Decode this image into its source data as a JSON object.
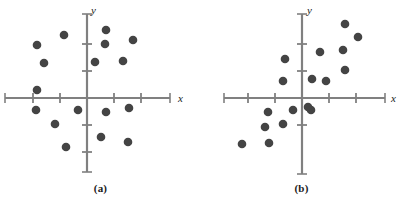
{
  "figure": {
    "width": 402,
    "height": 206,
    "background": "#ffffff",
    "dot_color": "#444444",
    "axis_color": "#808080",
    "label_color": "#1a1a1a"
  },
  "chart_data": [
    {
      "type": "scatter",
      "title": "(a)",
      "caption": "(a)",
      "xlabel": "x",
      "ylabel": "y",
      "grid": false,
      "legend": "none",
      "description": "No correlation — points scattered in all four quadrants",
      "origin_px": [
        87,
        98
      ],
      "unit_px": 27,
      "xlim": [
        -3.1,
        3.1
      ],
      "ylim": [
        -2.9,
        3.0
      ],
      "x_axis_px": [
        5,
        170
      ],
      "y_axis_px": [
        14,
        172
      ],
      "x_ticks": [
        -2,
        -1,
        1,
        2
      ],
      "y_ticks": [
        -2,
        -1,
        1,
        2
      ],
      "points_px": [
        [
          106,
          30
        ],
        [
          64,
          35
        ],
        [
          105,
          44
        ],
        [
          133,
          40
        ],
        [
          37,
          45
        ],
        [
          95,
          62
        ],
        [
          44,
          63
        ],
        [
          123,
          61
        ],
        [
          37,
          90
        ],
        [
          36,
          110
        ],
        [
          78,
          110
        ],
        [
          106,
          112
        ],
        [
          129,
          108
        ],
        [
          55,
          124
        ],
        [
          101,
          137
        ],
        [
          66,
          147
        ],
        [
          128,
          142
        ]
      ],
      "points": [
        [
          0.7,
          2.52
        ],
        [
          -0.85,
          2.33
        ],
        [
          0.67,
          2.0
        ],
        [
          1.7,
          2.15
        ],
        [
          -1.85,
          1.96
        ],
        [
          0.3,
          1.33
        ],
        [
          -1.59,
          1.3
        ],
        [
          1.33,
          1.37
        ],
        [
          -1.85,
          0.3
        ],
        [
          -1.89,
          -0.44
        ],
        [
          -0.33,
          -0.44
        ],
        [
          0.7,
          -0.52
        ],
        [
          1.56,
          -0.37
        ],
        [
          -1.19,
          -0.96
        ],
        [
          0.52,
          -1.44
        ],
        [
          -0.78,
          -1.81
        ],
        [
          1.52,
          -1.63
        ]
      ]
    },
    {
      "type": "scatter",
      "title": "(b)",
      "caption": "(b)",
      "xlabel": "x",
      "ylabel": "y",
      "grid": false,
      "legend": "none",
      "description": "Positive linear correlation — points trend upward left to right",
      "origin_px": [
        302,
        98
      ],
      "unit_px": 27,
      "xlim": [
        -3.0,
        3.1
      ],
      "ylim": [
        -2.9,
        3.0
      ],
      "x_axis_px": [
        224,
        385
      ],
      "y_axis_px": [
        14,
        174
      ],
      "x_ticks": [
        -2,
        -1,
        1,
        2
      ],
      "y_ticks": [
        -1,
        1,
        2
      ],
      "points_px": [
        [
          345,
          24
        ],
        [
          358,
          37
        ],
        [
          320,
          52
        ],
        [
          343,
          50
        ],
        [
          285,
          59
        ],
        [
          345,
          70
        ],
        [
          283,
          81
        ],
        [
          312,
          79
        ],
        [
          326,
          81
        ],
        [
          311,
          110
        ],
        [
          293,
          110
        ],
        [
          268,
          112
        ],
        [
          265,
          127
        ],
        [
          283,
          124
        ],
        [
          242,
          144
        ],
        [
          269,
          143
        ],
        [
          308,
          107
        ]
      ],
      "points": [
        [
          1.59,
          2.74
        ],
        [
          2.07,
          2.26
        ],
        [
          0.67,
          1.7
        ],
        [
          1.52,
          1.78
        ],
        [
          -0.63,
          1.44
        ],
        [
          1.59,
          1.04
        ],
        [
          -0.7,
          0.63
        ],
        [
          0.37,
          0.7
        ],
        [
          0.89,
          0.63
        ],
        [
          0.33,
          -0.44
        ],
        [
          -0.33,
          -0.44
        ],
        [
          -1.26,
          -0.52
        ],
        [
          -1.37,
          -1.07
        ],
        [
          -0.7,
          -0.96
        ],
        [
          -2.22,
          -1.7
        ],
        [
          -1.22,
          -1.67
        ],
        [
          0.22,
          -0.33
        ]
      ]
    }
  ],
  "panels": [
    {
      "caption": "(a)",
      "xlabel": "x",
      "ylabel": "y"
    },
    {
      "caption": "(b)",
      "xlabel": "x",
      "ylabel": "y"
    }
  ]
}
